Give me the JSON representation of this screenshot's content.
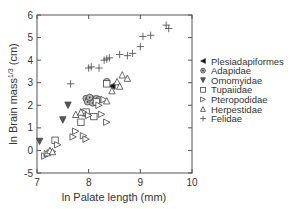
{
  "chart_data": {
    "type": "scatter",
    "title": "",
    "xlabel": "ln Palate length (mm)",
    "ylabel": "ln Brain mass^1/3 (cm)",
    "ylabel_main": "ln Brain mass",
    "ylabel_sup": "1/3",
    "ylabel_unit": " (cm)",
    "xlim": [
      7,
      10
    ],
    "ylim": [
      -1,
      6
    ],
    "x_ticks": [
      7,
      8,
      9,
      10
    ],
    "x_tick_labels": [
      "7",
      "8",
      "9",
      "10"
    ],
    "y_ticks": [
      6,
      5,
      4,
      3,
      2,
      1,
      0,
      -1
    ],
    "y_tick_labels": [
      "6",
      "5",
      "4",
      "3",
      "2",
      "1",
      "0",
      "-5"
    ],
    "grid": false,
    "legend_position": "right",
    "series": [
      {
        "name": "Plesiadapiformes",
        "marker": "left-triangle-filled",
        "points": [
          [
            8.45,
            2.85
          ]
        ]
      },
      {
        "name": "Adapidae",
        "marker": "circle-dot",
        "points": [
          [
            7.95,
            2.3
          ],
          [
            8.0,
            2.25
          ],
          [
            8.05,
            2.3
          ],
          [
            8.1,
            2.2
          ],
          [
            8.15,
            2.3
          ],
          [
            7.98,
            2.15
          ],
          [
            8.08,
            2.1
          ],
          [
            8.2,
            2.25
          ],
          [
            8.35,
            3.05
          ],
          [
            7.92,
            1.65
          ],
          [
            8.02,
            2.35
          ]
        ]
      },
      {
        "name": "Omomyidae",
        "marker": "down-triangle-filled",
        "points": [
          [
            7.05,
            0.4
          ],
          [
            7.5,
            1.35
          ],
          [
            7.6,
            2.0
          ]
        ]
      },
      {
        "name": "Tupaiidae",
        "marker": "square-open",
        "points": [
          [
            7.35,
            0.45
          ],
          [
            7.85,
            1.25
          ],
          [
            8.1,
            1.5
          ],
          [
            7.95,
            1.7
          ],
          [
            8.15,
            2.15
          ],
          [
            8.35,
            2.95
          ]
        ]
      },
      {
        "name": "Pteropodidae",
        "marker": "right-triangle-open",
        "points": [
          [
            7.15,
            -0.25
          ],
          [
            7.2,
            -0.15
          ],
          [
            7.3,
            -0.05
          ],
          [
            7.4,
            0.25
          ],
          [
            7.7,
            0.6
          ],
          [
            7.75,
            0.85
          ],
          [
            7.9,
            0.65
          ],
          [
            7.95,
            0.5
          ],
          [
            7.9,
            1.7
          ],
          [
            8.0,
            1.55
          ],
          [
            8.2,
            2.0
          ],
          [
            8.25,
            1.6
          ],
          [
            8.3,
            2.25
          ],
          [
            8.35,
            1.25
          ]
        ]
      },
      {
        "name": "Herpestidae",
        "marker": "up-triangle-open",
        "points": [
          [
            7.2,
            -0.1
          ],
          [
            7.25,
            0.0
          ],
          [
            7.3,
            -0.05
          ],
          [
            7.75,
            1.6
          ],
          [
            7.85,
            1.7
          ],
          [
            8.35,
            2.2
          ],
          [
            8.45,
            2.65
          ],
          [
            8.55,
            3.05
          ],
          [
            8.65,
            3.35
          ],
          [
            8.75,
            3.2
          ],
          [
            8.6,
            2.85
          ]
        ]
      },
      {
        "name": "Felidae",
        "marker": "plus",
        "points": [
          [
            7.65,
            2.95
          ],
          [
            8.0,
            3.65
          ],
          [
            8.05,
            3.7
          ],
          [
            8.2,
            3.65
          ],
          [
            8.3,
            4.0
          ],
          [
            8.35,
            4.05
          ],
          [
            8.4,
            4.1
          ],
          [
            8.6,
            4.25
          ],
          [
            8.75,
            4.2
          ],
          [
            8.85,
            4.3
          ],
          [
            9.0,
            4.6
          ],
          [
            9.05,
            5.05
          ],
          [
            9.2,
            5.1
          ],
          [
            9.5,
            5.55
          ],
          [
            9.55,
            5.4
          ]
        ]
      }
    ]
  },
  "legend": {
    "items": [
      {
        "label": "Plesiadapiformes",
        "icon": "left-triangle-filled-icon"
      },
      {
        "label": "Adapidae",
        "icon": "circle-dot-icon"
      },
      {
        "label": "Omomyidae",
        "icon": "down-triangle-filled-icon"
      },
      {
        "label": "Tupaiidae",
        "icon": "square-open-icon"
      },
      {
        "label": "Pteropodidae",
        "icon": "right-triangle-open-icon"
      },
      {
        "label": "Herpestidae",
        "icon": "up-triangle-open-icon"
      },
      {
        "label": "Felidae",
        "icon": "plus-icon"
      }
    ]
  },
  "colors": {
    "axis": "#555555",
    "marker_stroke": "#444444",
    "marker_fill_dark": "#555555",
    "text": "#333333"
  }
}
